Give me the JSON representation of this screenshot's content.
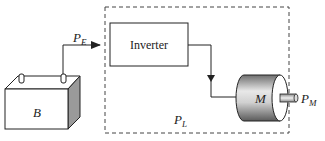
{
  "diagram": {
    "battery": {
      "label": "B"
    },
    "inverter": {
      "label": "Inverter"
    },
    "motor": {
      "label": "M"
    },
    "power_labels": {
      "electrical": {
        "symbol": "P",
        "subscript": "E"
      },
      "loss": {
        "symbol": "P",
        "subscript": "L"
      },
      "mechanical": {
        "symbol": "P",
        "subscript": "M"
      }
    },
    "colors": {
      "line": "#222222",
      "dashed_border": "#444444",
      "battery_side": "#9a9a9a",
      "motor_light": "#f0f0f0",
      "motor_dark": "#7a7a7a"
    }
  }
}
